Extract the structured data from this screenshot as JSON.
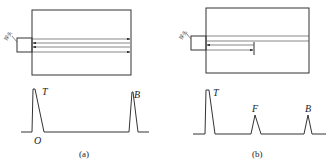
{
  "figure": {
    "panels": [
      {
        "id": "a",
        "caption": "(a)",
        "probe_label": "探头",
        "description": "Ultrasonic probe on block without defect; beam reflects from back wall",
        "waveform_labels": {
          "transmit": "T",
          "origin": "O",
          "back": "B"
        }
      },
      {
        "id": "b",
        "caption": "(b)",
        "probe_label": "探头",
        "description": "Ultrasonic probe on block with flaw; beam reflects from flaw",
        "waveform_labels": {
          "transmit": "T",
          "flaw": "F",
          "back": "B"
        }
      }
    ],
    "colors": {
      "line": "#333333",
      "background": "#ffffff"
    }
  }
}
